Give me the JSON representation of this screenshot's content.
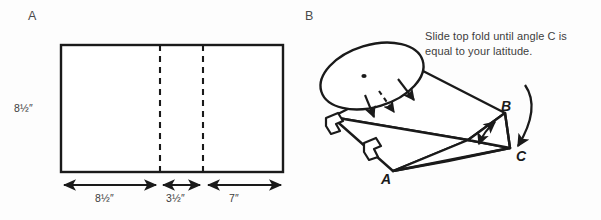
{
  "figure": {
    "background_color": "#fdfdfd",
    "ink_color": "#1a1a1a"
  },
  "panels": [
    {
      "id": "a",
      "label": "A",
      "caption": "Flat paper template with fold lines"
    },
    {
      "id": "b",
      "label": "B",
      "caption": "Assembled folded wedge with disc"
    }
  ],
  "panel_a": {
    "label": "A",
    "dimensions": {
      "height_label": "8½″",
      "segments": [
        {
          "name": "segment-1",
          "label": "8½″"
        },
        {
          "name": "segment-2",
          "label": "3½″"
        },
        {
          "name": "segment-3",
          "label": "7″"
        }
      ]
    },
    "rectangle": {
      "x": 61,
      "y": 45,
      "width": 222,
      "height": 127,
      "stroke": "#1a1a1a",
      "stroke_width": 2.2,
      "fill": "#ffffff"
    },
    "fold_lines": [
      {
        "name": "fold-line-1",
        "x": 160,
        "dash": "5,5"
      },
      {
        "name": "fold-line-2",
        "x": 203,
        "dash": "5,5"
      }
    ]
  },
  "panel_b": {
    "label": "B",
    "note": "Slide top fold until angle C is equal to your latitude.",
    "vertex_labels": [
      {
        "name": "vertex-a",
        "label": "A",
        "x": 381,
        "y": 178
      },
      {
        "name": "vertex-b",
        "label": "B",
        "x": 502,
        "y": 110
      },
      {
        "name": "vertex-c",
        "label": "C",
        "x": 518,
        "y": 155
      }
    ],
    "disc": {
      "name": "sundial-disc",
      "center_dot": true
    },
    "motion_arrows": [
      {
        "name": "slide-arrow-solid-1",
        "style": "solid"
      },
      {
        "name": "slide-arrow-solid-2",
        "style": "solid"
      },
      {
        "name": "slide-arrow-dashed",
        "style": "dashed"
      }
    ],
    "angle_arrow": {
      "name": "angle-adjust-arrow",
      "style": "double-headed"
    },
    "curved_arrow": {
      "name": "curved-pointer-arrow",
      "target": "C"
    },
    "tabs": [
      {
        "name": "tab-upper"
      },
      {
        "name": "tab-lower"
      }
    ]
  }
}
